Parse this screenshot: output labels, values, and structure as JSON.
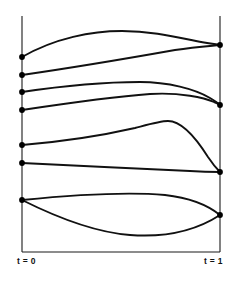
{
  "figure": {
    "title": "",
    "background_color": "#ffffff",
    "line_color": "#111111",
    "axis_color": "#1a1a1a",
    "node_color": "#000000"
  },
  "axes": {
    "left": {
      "label": "t = 0",
      "x": 22,
      "y_top": 16,
      "y_bottom": 252
    },
    "right": {
      "label": "t = 1",
      "x": 220,
      "y_top": 16,
      "y_bottom": 252
    },
    "baseline": {
      "y": 252,
      "x_start": 22,
      "x_end": 220
    }
  },
  "chart_data": {
    "type": "line",
    "title": "",
    "xlabel": "",
    "ylabel": "",
    "xlim": [
      0,
      1
    ],
    "ylim": [
      0,
      1
    ],
    "grid": false,
    "legend": false,
    "x_tick_labels": [
      "t = 0",
      "t = 1"
    ],
    "start_nodes": [
      {
        "id": "s1",
        "x": 22,
        "y": 57
      },
      {
        "id": "s2",
        "x": 22,
        "y": 75
      },
      {
        "id": "s3",
        "x": 22,
        "y": 92
      },
      {
        "id": "s4",
        "x": 22,
        "y": 110
      },
      {
        "id": "s5",
        "x": 22,
        "y": 145
      },
      {
        "id": "s6",
        "x": 22,
        "y": 163
      },
      {
        "id": "s7",
        "x": 22,
        "y": 200
      }
    ],
    "end_nodes": [
      {
        "id": "e1",
        "x": 220,
        "y": 45
      },
      {
        "id": "e2",
        "x": 220,
        "y": 105
      },
      {
        "id": "e3",
        "x": 220,
        "y": 172
      },
      {
        "id": "e4",
        "x": 220,
        "y": 215
      }
    ],
    "curves": [
      {
        "id": "c1",
        "from": "s1",
        "to": "e1",
        "path": "M 22 57 C 55 38, 92 31, 122 31 C 152 31, 176 37, 196 41 C 206 43, 214 44, 220 45"
      },
      {
        "id": "c2",
        "from": "s2",
        "to": "e1",
        "path": "M 22 75 C 70 68, 130 58, 175 50 C 195 47, 210 46, 220 45"
      },
      {
        "id": "c3",
        "from": "s3",
        "to": "e2",
        "path": "M 22 92 C 62 86, 105 82, 140 82 C 168 82, 195 89, 210 98 C 215 101, 218 103, 220 105"
      },
      {
        "id": "c4",
        "from": "s4",
        "to": "e2",
        "path": "M 22 110 C 62 104, 110 97, 150 94 C 180 92, 205 98, 214 102 C 217 103, 219 104, 220 105"
      },
      {
        "id": "c5",
        "from": "s5",
        "to": "e3",
        "path": "M 22 145 C 58 142, 100 136, 135 128 C 150 124, 160 121, 168 121 C 182 121, 196 138, 208 157 C 214 166, 218 170, 220 172"
      },
      {
        "id": "c6",
        "from": "s6",
        "to": "e3",
        "path": "M 22 163 C 70 165, 140 169, 190 171 C 205 172, 215 172, 220 172"
      },
      {
        "id": "c7",
        "from": "s7",
        "to": "e4",
        "path": "M 22 200 C 62 196, 120 191, 165 195 C 192 198, 210 207, 220 215"
      },
      {
        "id": "c8",
        "from": "s7",
        "to": "e4",
        "path": "M 22 200 C 50 214, 90 232, 130 235 C 170 238, 200 228, 220 215"
      }
    ]
  }
}
